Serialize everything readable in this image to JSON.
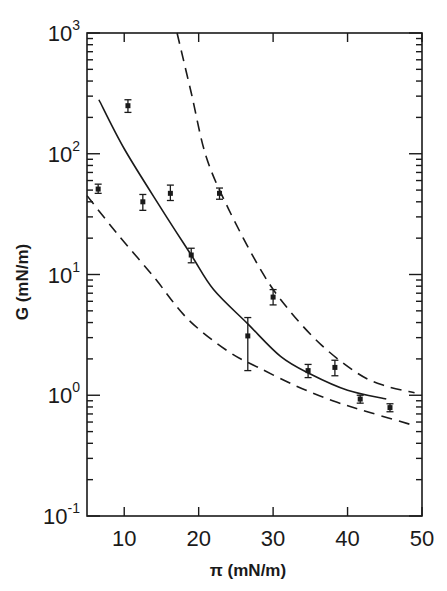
{
  "chart_data": {
    "type": "scatter",
    "title": "",
    "xlabel": "π (mN/m)",
    "ylabel": "G (mN/m)",
    "xscale": "linear",
    "yscale": "log",
    "xlim": [
      5,
      50
    ],
    "ylim": [
      0.1,
      1000
    ],
    "x_ticks": [
      10,
      20,
      30,
      40,
      50
    ],
    "x_tick_labels": [
      "10",
      "20",
      "30",
      "40",
      "50"
    ],
    "y_ticks": [
      0.1,
      1,
      10,
      100,
      1000
    ],
    "y_tick_labels": [
      {
        "base": "10",
        "exp": "-1"
      },
      {
        "base": "10",
        "exp": "0"
      },
      {
        "base": "10",
        "exp": "1"
      },
      {
        "base": "10",
        "exp": "2"
      },
      {
        "base": "10",
        "exp": "3"
      }
    ],
    "grid": false,
    "legend": null,
    "series": [
      {
        "name": "measured G",
        "style": "points-with-error-bars",
        "points": [
          {
            "x": 6.5,
            "y": 51,
            "err_low": 47,
            "err_high": 56
          },
          {
            "x": 10.5,
            "y": 250,
            "err_low": 220,
            "err_high": 280
          },
          {
            "x": 12.5,
            "y": 40,
            "err_low": 34,
            "err_high": 46
          },
          {
            "x": 16.2,
            "y": 47,
            "err_low": 41,
            "err_high": 55
          },
          {
            "x": 19.0,
            "y": 14.5,
            "err_low": 12.5,
            "err_high": 16.5
          },
          {
            "x": 22.8,
            "y": 47,
            "err_low": 42,
            "err_high": 52
          },
          {
            "x": 26.6,
            "y": 3.1,
            "err_low": 1.6,
            "err_high": 4.4
          },
          {
            "x": 30.0,
            "y": 6.5,
            "err_low": 5.6,
            "err_high": 7.5
          },
          {
            "x": 34.7,
            "y": 1.6,
            "err_low": 1.4,
            "err_high": 1.8
          },
          {
            "x": 38.3,
            "y": 1.7,
            "err_low": 1.45,
            "err_high": 1.95
          },
          {
            "x": 41.7,
            "y": 0.93,
            "err_low": 0.86,
            "err_high": 1.0
          },
          {
            "x": 45.7,
            "y": 0.79,
            "err_low": 0.73,
            "err_high": 0.85
          }
        ]
      },
      {
        "name": "theory (solid)",
        "style": "solid",
        "points": [
          {
            "x": 6.6,
            "y": 280
          },
          {
            "x": 10,
            "y": 110
          },
          {
            "x": 15,
            "y": 35
          },
          {
            "x": 19.0,
            "y": 14.5
          },
          {
            "x": 22,
            "y": 7.5
          },
          {
            "x": 26.6,
            "y": 3.9
          },
          {
            "x": 31,
            "y": 2.1
          },
          {
            "x": 35,
            "y": 1.5
          },
          {
            "x": 40,
            "y": 1.1
          },
          {
            "x": 45.2,
            "y": 0.93
          }
        ]
      },
      {
        "name": "upper bound (dashed)",
        "style": "dashed",
        "points": [
          {
            "x": 17.1,
            "y": 1000
          },
          {
            "x": 19,
            "y": 320
          },
          {
            "x": 21,
            "y": 95
          },
          {
            "x": 24,
            "y": 35
          },
          {
            "x": 28.5,
            "y": 10.5
          },
          {
            "x": 32,
            "y": 5.2
          },
          {
            "x": 36.5,
            "y": 2.6
          },
          {
            "x": 41.5,
            "y": 1.5
          },
          {
            "x": 45,
            "y": 1.2
          },
          {
            "x": 49,
            "y": 1.05
          }
        ]
      },
      {
        "name": "lower bound (dashed)",
        "style": "dashed",
        "points": [
          {
            "x": 5.0,
            "y": 45
          },
          {
            "x": 9,
            "y": 22
          },
          {
            "x": 14,
            "y": 9.5
          },
          {
            "x": 18.5,
            "y": 4.3
          },
          {
            "x": 24,
            "y": 2.3
          },
          {
            "x": 28,
            "y": 1.7
          },
          {
            "x": 33,
            "y": 1.2
          },
          {
            "x": 38,
            "y": 0.9
          },
          {
            "x": 43,
            "y": 0.72
          },
          {
            "x": 49,
            "y": 0.56
          }
        ]
      }
    ]
  }
}
